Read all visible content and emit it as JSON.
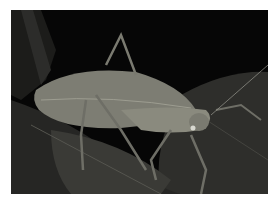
{
  "image": {
    "subject": "katydid on leaves",
    "background_color": "#060606",
    "border_color": "#ffffff",
    "colors": {
      "insect": "#8a8a7e",
      "insect_dark": "#5c5c54",
      "leaf": "#3a3a36",
      "leaf_dark": "#242422"
    }
  }
}
